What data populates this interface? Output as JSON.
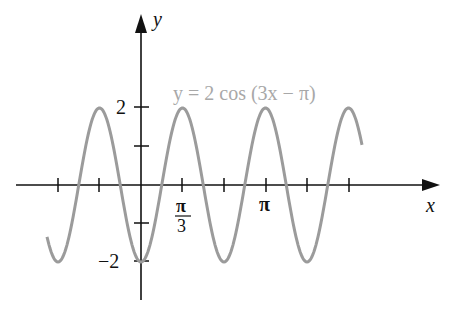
{
  "chart_data": {
    "type": "line",
    "title": "",
    "function_label": "y = 2 cos (3x − π)",
    "xlabel": "x",
    "ylabel": "y",
    "x_tick_labels": [
      {
        "value": "π/3",
        "num": "π",
        "den": "3"
      },
      {
        "value": "π",
        "text": "π"
      }
    ],
    "y_tick_labels": [
      "2",
      "−2"
    ],
    "ylim": [
      -2.5,
      2.5
    ],
    "xlim": [
      -2.3,
      7.2
    ],
    "amplitude": 2,
    "frequency": 3,
    "phase": "π",
    "series": [
      {
        "name": "y = 2 cos (3x − π)",
        "color": "#9b9b9b"
      }
    ],
    "grid": false,
    "legend": "none"
  },
  "labels": {
    "func": "y = 2 cos (3x − π)",
    "x_axis": "x",
    "y_axis": "y",
    "y_top": "2",
    "y_bottom": "−2",
    "xt_pi": "π",
    "xt_pi3_num": "π",
    "xt_pi3_den": "3"
  }
}
